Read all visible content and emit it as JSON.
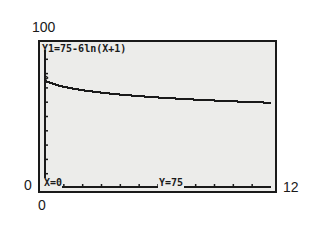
{
  "chart_data": {
    "type": "line",
    "title": "Y1=75-6ln(X+1)",
    "equation": "Y1=75-6ln(X+1)",
    "xlabel": "",
    "ylabel": "",
    "xlim": [
      0,
      12
    ],
    "ylim": [
      0,
      100
    ],
    "x_tick_labels": [
      "0",
      "12"
    ],
    "y_tick_labels": [
      "0",
      "100"
    ],
    "grid": false,
    "trace": {
      "x_label": "X=0",
      "y_label": "Y=75"
    },
    "series": [
      {
        "name": "Y1",
        "x": [
          0,
          1,
          2,
          3,
          4,
          5,
          6,
          7,
          8,
          9,
          10,
          11,
          12
        ],
        "values": [
          75,
          70.8,
          68.4,
          66.7,
          65.3,
          64.2,
          63.3,
          62.5,
          61.8,
          61.2,
          60.6,
          60.1,
          59.6
        ]
      }
    ]
  },
  "labels": {
    "ymax": "100",
    "ymin": "0",
    "xmin": "0",
    "xmax": "12"
  },
  "screen": {
    "equation_text": "Y1=75-6ln(X+1)",
    "trace_x": "X=0",
    "trace_y": "Y=75"
  },
  "colors": {
    "lcd_background": "#ececea",
    "ink": "#1a1a1a"
  }
}
